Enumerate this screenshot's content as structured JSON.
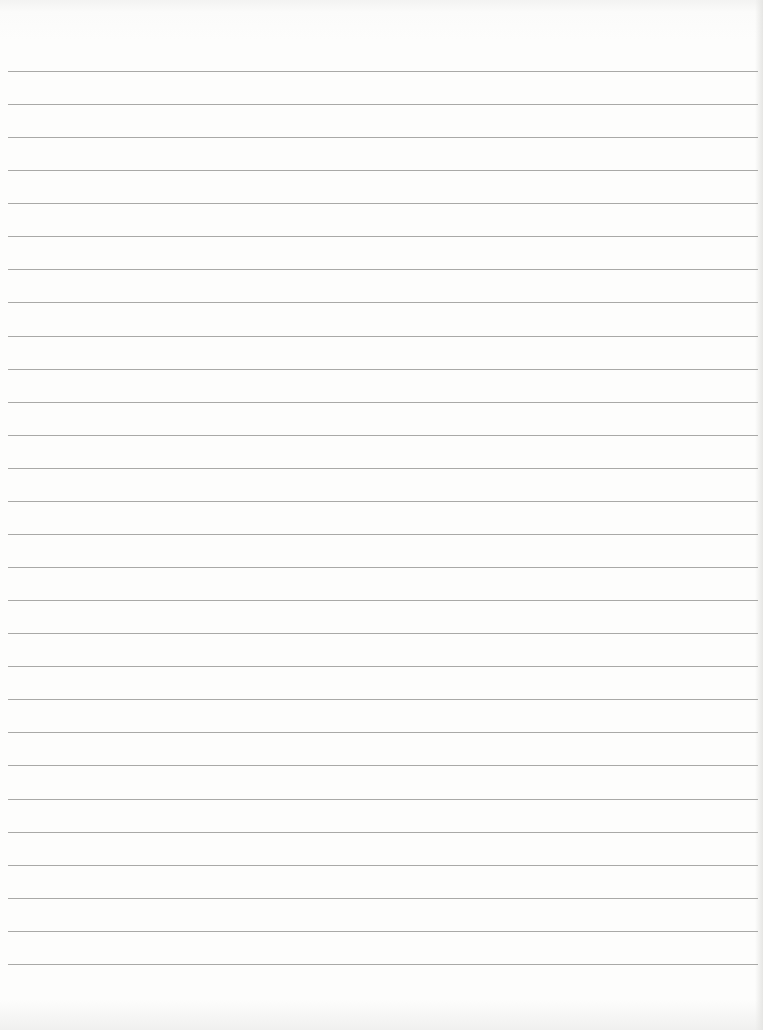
{
  "document": {
    "type": "lined-paper",
    "background_color": "#fdfdfc",
    "rule_color": "#9a9a98",
    "rule_count": 28,
    "first_rule_y": 71,
    "rule_spacing": 33.07,
    "text_content": ""
  }
}
